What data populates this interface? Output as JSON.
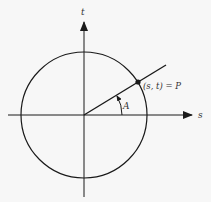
{
  "diagram": {
    "axis_x_label": "s",
    "axis_y_label": "t",
    "point_label": "(s, t) = P",
    "angle_label": "A",
    "colors": {
      "background": "#f7f7f7",
      "stroke": "#1a1a1a"
    }
  }
}
